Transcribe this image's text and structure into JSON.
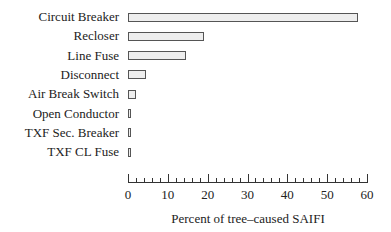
{
  "chart_data": {
    "type": "bar",
    "orientation": "horizontal",
    "title": "",
    "xlabel": "Percent of tree–caused SAIFI",
    "ylabel": "",
    "xlim": [
      0,
      60
    ],
    "xticks": [
      "0",
      "10",
      "20",
      "30",
      "40",
      "50",
      "60"
    ],
    "minor_tick_step": 2,
    "grid": false,
    "legend": null,
    "categories": [
      "Circuit Breaker",
      "Recloser",
      "Line Fuse",
      "Disconnect",
      "Air Break Switch",
      "Open Conductor",
      "TXF Sec. Breaker",
      "TXF CL Fuse"
    ],
    "values": [
      57.8,
      19.1,
      14.6,
      4.5,
      2.0,
      0.8,
      0.8,
      0.4
    ],
    "bar_fill": "#eeeeee",
    "bar_edge": "#555555"
  }
}
